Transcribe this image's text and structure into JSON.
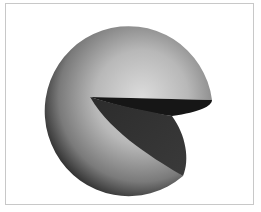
{
  "figure": {
    "colors": {
      "background": "#ffffff",
      "frame_border": "#c8c8c8",
      "sphere_highlight": "#d9d9d9",
      "sphere_mid": "#9a9a9a",
      "sphere_shadow": "#2a2a2a",
      "upper_cut_face": "#161616",
      "lower_cut_face": "#343434"
    }
  }
}
